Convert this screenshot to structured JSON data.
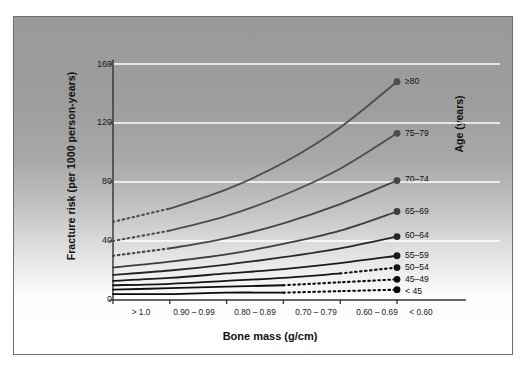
{
  "chart_data": {
    "type": "line",
    "title": "",
    "xlabel": "Bone mass (g/cm)",
    "ylabel": "Fracture risk (per 1000 person-years)",
    "legend_title": "Age (years)",
    "legend_position": "right-inline",
    "grid": "horizontal-white",
    "categories": [
      "> 1.0",
      "0.90 – 0.99",
      "0.80 – 0.89",
      "0.70 – 0.79",
      "0.60 – 0.69",
      "< 0.60"
    ],
    "xtick_labels": [
      "> 1.0",
      "0.90 – 0.99",
      "0.80 – 0.89",
      "0.70 – 0.79",
      "0.60 – 0.69",
      "< 0.60"
    ],
    "ytick_labels": [
      "0",
      "40",
      "80",
      "120",
      "160"
    ],
    "yticks": [
      0,
      40,
      80,
      120,
      160
    ],
    "ylim": [
      0,
      170
    ],
    "xlim": [
      0,
      5
    ],
    "series": [
      {
        "name": "≥80",
        "label": "≥80",
        "values": [
          53,
          62,
          75,
          93,
          117,
          148
        ],
        "extrapolated_from": 1,
        "color": "#4d4d4d",
        "endpoint": 148
      },
      {
        "name": "75–79",
        "label": "75–79",
        "values": [
          40,
          47,
          57,
          71,
          89,
          113
        ],
        "extrapolated_from": 1,
        "color": "#4d4d4d",
        "endpoint": 113
      },
      {
        "name": "70–74",
        "label": "70–74",
        "values": [
          30,
          35,
          42,
          52,
          65,
          81
        ],
        "extrapolated_from": 1,
        "color": "#454545",
        "endpoint": 81
      },
      {
        "name": "65–69",
        "label": "65–69",
        "values": [
          22,
          26,
          31,
          38,
          47,
          60
        ],
        "extrapolated_from": 0,
        "color": "#3d3d3d",
        "endpoint": 60
      },
      {
        "name": "60–64",
        "label": "60–64",
        "values": [
          17,
          20,
          24,
          29,
          35,
          43
        ],
        "extrapolated_from": 0,
        "color": "#262626",
        "endpoint": 43
      },
      {
        "name": "55–59",
        "label": "55–59",
        "values": [
          13,
          15,
          18,
          21,
          25,
          30
        ],
        "extrapolated_from": 0,
        "color": "#1a1a1a",
        "endpoint": 30
      },
      {
        "name": "50–54",
        "label": "50–54",
        "values": [
          10,
          11,
          13,
          15,
          18,
          22
        ],
        "extrapolated_to": 4,
        "color": "#141414",
        "endpoint": 22
      },
      {
        "name": "45–49",
        "label": "45–49",
        "values": [
          7,
          8,
          9,
          10,
          12,
          14
        ],
        "extrapolated_to": 3,
        "color": "#0d0d0d",
        "endpoint": 14
      },
      {
        "name": "< 45",
        "label": "< 45",
        "values": [
          4,
          4,
          5,
          5,
          6,
          7
        ],
        "extrapolated_to": 3,
        "color": "#080808",
        "endpoint": 7
      }
    ]
  },
  "axes": {
    "y_title": "Fracture risk (per 1000 person-years)",
    "x_title": "Bone mass (g/cm)",
    "legend_title": "Age (years)"
  },
  "colors": {
    "panel_top": "#9a9a9a",
    "panel_bottom": "#ffffff",
    "gridline": "#ffffff",
    "axis": "#333333",
    "frame": "#6e6e6e",
    "curve": "#333333"
  }
}
